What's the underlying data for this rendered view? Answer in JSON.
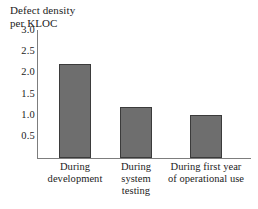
{
  "chart_data": {
    "type": "bar",
    "title": "Defect density\nper KLOC",
    "xlabel": "",
    "ylabel": "Defect density per KLOC",
    "categories": [
      "During\ndevelopment",
      "During\nsystem\ntesting",
      "During first year\nof operational use"
    ],
    "values": [
      2.2,
      1.2,
      1.0
    ],
    "ylim": [
      0,
      3.0
    ],
    "yticks": [
      3.0,
      2.5,
      2.0,
      1.5,
      1.0,
      0.5
    ],
    "ytick_labels": [
      "3.0",
      "2.5",
      "2.0",
      "1.5",
      "1.0",
      "0.5"
    ],
    "grid": false,
    "legend": false,
    "bar_color": "#6e6e6e",
    "bar_edge_color": "#3b3b3b",
    "axis_color": "#7d7d7d",
    "background": "#ffffff"
  },
  "caption": {
    "cutoff_text": ""
  }
}
